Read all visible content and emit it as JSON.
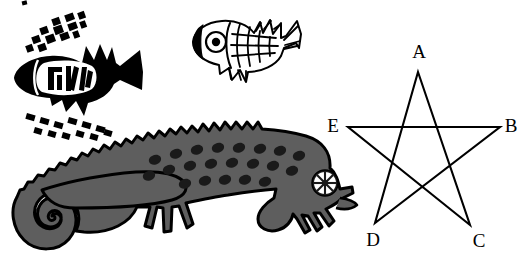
{
  "figure": {
    "background_color": "#ffffff",
    "ink_color": "#000000",
    "chameleon_fill": "#5e5e5e",
    "width": 525,
    "height": 258
  },
  "star": {
    "name": "five-pointed-star",
    "stroke_color": "#000000",
    "stroke_width": 2.1,
    "fill": "none",
    "draw_order": [
      "A",
      "C",
      "E",
      "B",
      "D",
      "A"
    ],
    "vertices": [
      {
        "label": "A",
        "x": 418,
        "y": 72,
        "label_x": 419,
        "label_y": 58,
        "label_anchor": "middle"
      },
      {
        "label": "B",
        "x": 500,
        "y": 127,
        "label_x": 511,
        "label_y": 132,
        "label_anchor": "middle"
      },
      {
        "label": "C",
        "x": 470,
        "y": 225,
        "label_x": 479,
        "label_y": 247,
        "label_anchor": "middle"
      },
      {
        "label": "D",
        "x": 375,
        "y": 223,
        "label_x": 373,
        "label_y": 246,
        "label_anchor": "middle"
      },
      {
        "label": "E",
        "x": 348,
        "y": 127,
        "label_x": 333,
        "label_y": 132,
        "label_anchor": "middle"
      }
    ]
  },
  "fish_black": {
    "name": "black-filled-fish",
    "fill": "#000000",
    "description": "solid black stylized fish facing left with white inner body panel, black tick marks above and below"
  },
  "fish_outline": {
    "name": "outlined-scaled-fish",
    "fill": "#ffffff",
    "stroke": "#000000",
    "description": "outline fish facing left with scale grid, ringed eye and fanned fins"
  },
  "chameleon": {
    "name": "chameleon",
    "fill": "#5e5e5e",
    "stroke": "#000000",
    "description": "gray chameleon facing right with spiked dorsal crest, teardrop scale marks, curled tail, spoked eye and clasping feet"
  }
}
